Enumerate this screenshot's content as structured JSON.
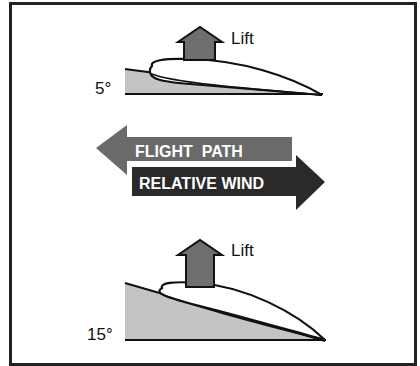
{
  "diagram": {
    "top_panel": {
      "angle_label": "5°",
      "lift_label": "Lift"
    },
    "middle_panel": {
      "flight_path_label": "FLIGHT  PATH",
      "relative_wind_label": "RELATIVE WIND"
    },
    "bottom_panel": {
      "angle_label": "15°",
      "lift_label": "Lift"
    }
  },
  "colors": {
    "frame": "#222222",
    "wedge_fill": "#c4c4c4",
    "lift_arrow": "#6e6e6e",
    "flight_path_arrow": "#6a6a6a",
    "relative_wind_arrow": "#2a2a2a",
    "text_on_arrow": "#ffffff"
  }
}
